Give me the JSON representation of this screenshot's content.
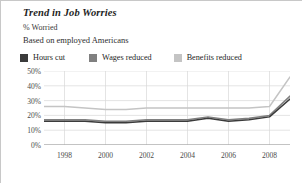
{
  "header": {
    "title": "Trend in Job Worries",
    "y_unit_label": "% Worried",
    "subtitle": "Based on employed Americans"
  },
  "legend": {
    "position": "top",
    "items": [
      {
        "label": "Hours cut",
        "color": "#3b3b3b",
        "swatch": "legend-swatch-hours-cut"
      },
      {
        "label": "Wages reduced",
        "color": "#808080",
        "swatch": "legend-swatch-wages-reduced"
      },
      {
        "label": "Benefits reduced",
        "color": "#c4c4c4",
        "swatch": "legend-swatch-benefits-reduced"
      }
    ]
  },
  "axes": {
    "y_ticks": [
      "0%",
      "10%",
      "20%",
      "30%",
      "40%",
      "50%"
    ],
    "y_values": [
      0,
      10,
      20,
      30,
      40,
      50
    ],
    "x_ticks": [
      "1998",
      "2000",
      "2002",
      "2004",
      "2006",
      "2008"
    ],
    "x_values": [
      1998,
      2000,
      2002,
      2004,
      2006,
      2008
    ]
  },
  "colors": {
    "grid": "#d9d9d9",
    "axis": "#9a9a9a",
    "background": "#ffffff",
    "text": "#2b2b2b"
  },
  "chart_data": {
    "type": "line",
    "title": "Trend in Job Worries",
    "subtitle": "Based on employed Americans",
    "xlabel": "",
    "ylabel": "% Worried",
    "ylim": [
      0,
      50
    ],
    "xlim": [
      1997,
      2009
    ],
    "grid": true,
    "legend_position": "top",
    "x": [
      1997,
      1998,
      1999,
      2000,
      2001,
      2002,
      2003,
      2004,
      2005,
      2006,
      2007,
      2008,
      2009
    ],
    "series": [
      {
        "name": "Hours cut",
        "color": "#3b3b3b",
        "values": [
          16,
          16,
          16,
          15,
          15,
          16,
          16,
          16,
          18,
          16,
          17,
          19,
          31
        ]
      },
      {
        "name": "Wages reduced",
        "color": "#808080",
        "values": [
          17,
          17,
          17,
          16,
          16,
          17,
          17,
          17,
          19,
          17,
          18,
          20,
          33
        ]
      },
      {
        "name": "Benefits reduced",
        "color": "#c4c4c4",
        "values": [
          26,
          26,
          25,
          24,
          24,
          25,
          25,
          25,
          25,
          25,
          25,
          26,
          46
        ]
      }
    ]
  }
}
